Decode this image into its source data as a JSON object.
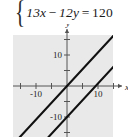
{
  "equation": {
    "brace": "{",
    "left_term": "13x",
    "operator": "−",
    "right_term": "12y",
    "equals": "=",
    "value": "120",
    "full_text": "13x − 12y = 120"
  },
  "chart_data": {
    "type": "line",
    "title": "",
    "xlabel": "x",
    "ylabel": "y",
    "xlim": [
      -17,
      15
    ],
    "ylim": [
      -17,
      17
    ],
    "grid": false,
    "legend": null,
    "background_color": "#e9e9e9",
    "line_color": "#111111",
    "axis_color": "#555555",
    "x_ticks": [
      -15,
      -10,
      -5,
      5,
      10,
      15
    ],
    "y_ticks": [
      -15,
      -10,
      -5,
      5,
      10,
      15
    ],
    "x_tick_labels": [
      {
        "value": -10,
        "label": "-10"
      },
      {
        "value": 10,
        "label": "10"
      }
    ],
    "y_tick_labels": [
      {
        "value": 10,
        "label": "10"
      },
      {
        "value": -10,
        "label": "-10"
      }
    ],
    "series": [
      {
        "name": "13x - 12y = 0",
        "slope": 1.0833,
        "intercept": 0,
        "x": [
          -17,
          15
        ],
        "y": [
          -18.42,
          16.25
        ]
      },
      {
        "name": "13x - 12y = 120",
        "slope": 1.0833,
        "intercept": -10,
        "x": [
          -17,
          15
        ],
        "y": [
          -28.42,
          6.25
        ]
      }
    ]
  },
  "labels": {
    "x_axis": "x",
    "y_axis": "y",
    "x_neg_ten": "-10",
    "x_pos_ten": "10",
    "y_pos_ten": "10",
    "y_neg_ten": "-10"
  }
}
